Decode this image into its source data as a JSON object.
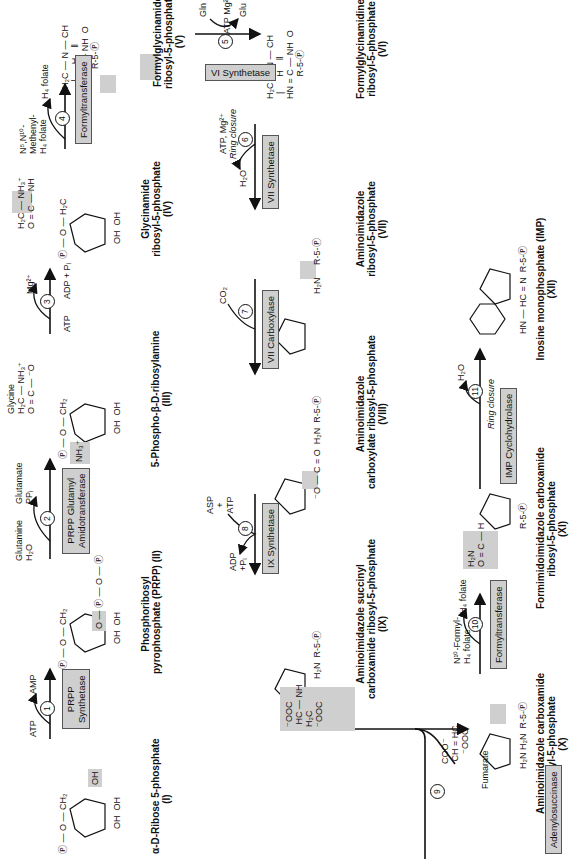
{
  "compounds": [
    {
      "id": "I",
      "name": "α-D-Ribose 5-phosphate",
      "numeral": "(I)"
    },
    {
      "id": "II",
      "name_line1": "Phosphoribosyl",
      "name_line2": "pyrophosphate (PRPP) (II)"
    },
    {
      "id": "III",
      "name": "5-Phospho-β-D-ribosylamine",
      "numeral": "(III)"
    },
    {
      "id": "IV",
      "name_line1": "Glycinamide",
      "name_line2": "ribosyl-5-phosphate",
      "numeral": "(IV)"
    },
    {
      "id": "V",
      "name_line1": "Formylglycinamide",
      "name_line2": "ribosyl-5-phosphate",
      "numeral": "(V)"
    },
    {
      "id": "VI",
      "name_line1": "Formylglycinamidine",
      "name_line2": "ribosyl-5-phosphate",
      "numeral": "(VI)"
    },
    {
      "id": "VII",
      "name_line1": "Aminoimidazole",
      "name_line2": "ribosyl-5-phosphate",
      "numeral": "(VII)"
    },
    {
      "id": "VIII",
      "name_line1": "Aminoimidazole",
      "name_line2": "carboxylate ribosyl-5-phosphate",
      "numeral": "(VIII)"
    },
    {
      "id": "IX",
      "name_line1": "Aminoimidazole succinyl",
      "name_line2": "carboxamide ribosyl-5-phosphate",
      "numeral": "(IX)"
    },
    {
      "id": "X",
      "name_line1": "Aminoimidazole carboxamide",
      "name_line2": "ribosyl-5-phosphate",
      "numeral": "(X)"
    },
    {
      "id": "XI",
      "name_line1": "Formimidoimidazole carboxamide",
      "name_line2": "ribosyl-5-phosphate",
      "numeral": "(XI)"
    },
    {
      "id": "XII",
      "name": "Inosine monophosphate (IMP)",
      "numeral": "(XII)"
    }
  ],
  "steps": [
    {
      "n": "1",
      "enzyme_line1": "PRPP",
      "enzyme_line2": "Synthetase",
      "in": "ATP",
      "out": "AMP"
    },
    {
      "n": "2",
      "enzyme_line1": "PRPP Glutamyl",
      "enzyme_line2": "Amidotransferase",
      "in": "Glutamine",
      "in2": "H₂O",
      "out": "Glutamate",
      "out2": "PPᵢ"
    },
    {
      "n": "3",
      "enzyme": "",
      "in": "ATP",
      "out": "ADP + Pᵢ",
      "cofactor": "Mg²⁺",
      "reactant": "Glycine"
    },
    {
      "n": "4",
      "enzyme": "Formyltransferase",
      "in_line1": "N⁵,N¹⁰-",
      "in_line2": "Methenyl-",
      "in_line3": "H₄ folate",
      "out": "H₄ folate"
    },
    {
      "n": "5",
      "enzyme": "VI Synthetase",
      "in": "Gln",
      "cofactor": "ATP Mg²⁺",
      "out": "Glu"
    },
    {
      "n": "6",
      "enzyme": "VII Synthetase",
      "in": "ATP, Mg²⁺",
      "note": "Ring closure",
      "out": "H₂O"
    },
    {
      "n": "7",
      "enzyme": "VII Carboxylase",
      "in": "CO₂"
    },
    {
      "n": "8",
      "enzyme": "IX Synthetase",
      "in_line1": "ASP",
      "in_line2": "+",
      "in_line3": "ATP",
      "out_line1": "ADP",
      "out_line2": "+Pᵢ"
    },
    {
      "n": "9",
      "enzyme": "Adenylosuccinase",
      "out": "Fumarate"
    },
    {
      "n": "10",
      "enzyme": "Formyltransferase",
      "in_line1": "N¹⁰-Formyl-",
      "in_line2": "H₄ folate",
      "out": "H₄ folate"
    },
    {
      "n": "11",
      "enzyme": "IMP Cyclohydrolase",
      "note": "Ring closure",
      "out": "H₂O"
    }
  ],
  "atoms": {
    "P": "P",
    "O": "O",
    "CH2": "CH₂",
    "OH": "OH",
    "H": "H",
    "NH3": "NH₃⁺",
    "R5P": "R-5-",
    "NH": "NH",
    "CH": "CH",
    "N": "N",
    "C": "C",
    "H2N": "H₂N",
    "HN": "HN",
    "HC": "HC",
    "OOC": "⁻OOC",
    "COO": "COO⁻",
    "H2C": "H₂C",
    "Ominus": "⁻O"
  },
  "colors": {
    "highlight": "#cfcfcf",
    "ink": "#111111",
    "background": "#ffffff"
  }
}
